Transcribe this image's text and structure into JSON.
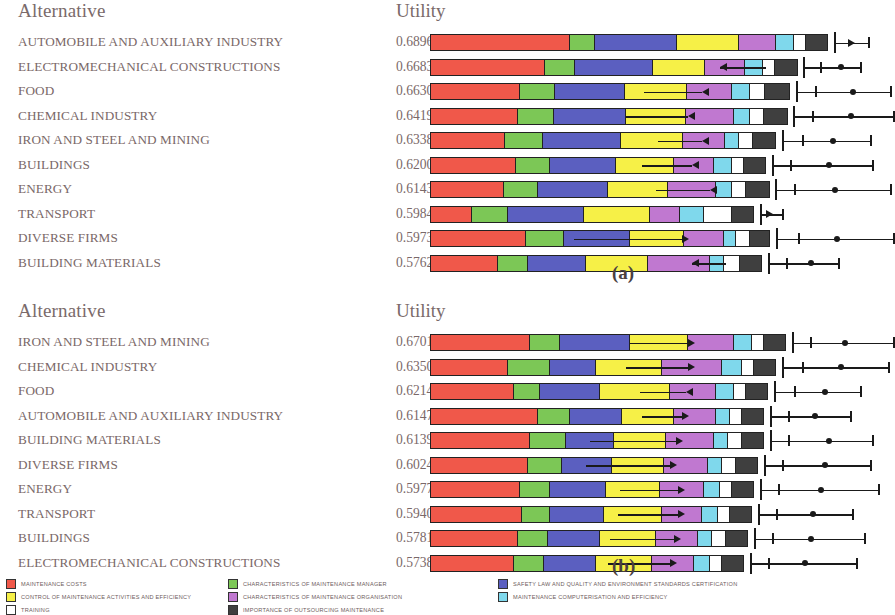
{
  "columns": {
    "alternative": "Alternative",
    "utility": "Utility"
  },
  "captions": {
    "a": "(a)",
    "b": "(b)"
  },
  "colors": {
    "maintenance_costs": "#F0584A",
    "control_of_maintenance_activities": "#F6F047",
    "training": "#FFFFFF",
    "characteristics_manager": "#7CC756",
    "characteristics_organisation": "#C078D0",
    "importance_outsourcing": "#3F3F3F",
    "safety_law": "#5B5FC0",
    "computerisation": "#7FD8EC",
    "outline": "#1a1a1a"
  },
  "legend": {
    "columns": [
      {
        "items": [
          {
            "label": "MAINTENANCE COSTS",
            "color": "#F0584A"
          },
          {
            "label": "CONTROL OF MAINTENANCE ACTIVITIES AND EFFICIENCY",
            "color": "#F6F047"
          },
          {
            "label": "TRAINING",
            "color": "#FFFFFF"
          }
        ]
      },
      {
        "items": [
          {
            "label": "CHARACTERISTICS OF MAINTENANCE MANAGER",
            "color": "#7CC756"
          },
          {
            "label": "CHARACTERISTICS OF MAINTENANCE ORGANISATION",
            "color": "#C078D0"
          },
          {
            "label": "IMPORTANCE OF OUTSOURCING MAINTENANCE",
            "color": "#3F3F3F"
          }
        ]
      },
      {
        "items": [
          {
            "label": "SAFETY LAW AND QUALITY AND ENVIRONMENT STANDARDS CERTIFICATION",
            "color": "#5B5FC0"
          },
          {
            "label": "MAINTENANCE COMPUTERISATION AND EFFICIENCY",
            "color": "#7FD8EC"
          }
        ]
      }
    ]
  },
  "chart_data": [
    {
      "id": "a",
      "type": "bar",
      "orientation": "horizontal",
      "stacked": true,
      "title": "(a)",
      "xlabel": "",
      "ylabel": "Alternative",
      "value_label": "Utility",
      "series": [
        {
          "name": "MAINTENANCE COSTS",
          "color": "#F0584A"
        },
        {
          "name": "CHARACTERISTICS OF MAINTENANCE MANAGER",
          "color": "#7CC756"
        },
        {
          "name": "SAFETY LAW AND QUALITY AND ENVIRONMENT STANDARDS CERTIFICATION",
          "color": "#5B5FC0"
        },
        {
          "name": "CONTROL OF MAINTENANCE ACTIVITIES AND EFFICIENCY",
          "color": "#F6F047"
        },
        {
          "name": "CHARACTERISTICS OF MAINTENANCE ORGANISATION",
          "color": "#C078D0"
        },
        {
          "name": "MAINTENANCE COMPUTERISATION AND EFFICIENCY",
          "color": "#7FD8EC"
        },
        {
          "name": "TRAINING",
          "color": "#FFFFFF"
        },
        {
          "name": "IMPORTANCE OF OUTSOURCING MAINTENANCE",
          "color": "#3F3F3F"
        }
      ],
      "rows": [
        {
          "alternative": "AUTOMOBILE AND AUXILIARY INDUSTRY",
          "utility": "0.6896",
          "segments": [
            140,
            25,
            82,
            62,
            37,
            18,
            12,
            22
          ],
          "bar_total": 398,
          "tick": 404,
          "whisk_start": 404,
          "whisk_end": 438,
          "markers": [],
          "dots": [],
          "inner_line": null,
          "arrow": {
            "x": 418,
            "dir": "right"
          }
        },
        {
          "alternative": "ELECTROMECHANICAL CONSTRUCTIONS",
          "utility": "0.6683",
          "segments": [
            115,
            30,
            78,
            52,
            40,
            18,
            12,
            23
          ],
          "bar_total": 368,
          "tick": 373,
          "whisk_start": 373,
          "whisk_end": 430,
          "markers": [
            390
          ],
          "dots": [
            408
          ],
          "inner_line": {
            "x1": 290,
            "x2": 336
          },
          "arrow": {
            "x": 290,
            "dir": "left"
          }
        },
        {
          "alternative": "FOOD",
          "utility": "0.6630",
          "segments": [
            90,
            35,
            70,
            62,
            45,
            18,
            15,
            25
          ],
          "bar_total": 360,
          "tick": 366,
          "whisk_start": 366,
          "whisk_end": 460,
          "markers": [
            385
          ],
          "dots": [
            420
          ],
          "inner_line": {
            "x1": 214,
            "x2": 272
          },
          "arrow": {
            "x": 272,
            "dir": "left"
          }
        },
        {
          "alternative": "CHEMICAL INDUSTRY",
          "utility": "0.6419",
          "segments": [
            88,
            36,
            72,
            60,
            48,
            16,
            14,
            24
          ],
          "bar_total": 358,
          "tick": 363,
          "whisk_start": 363,
          "whisk_end": 463,
          "markers": [
            382
          ],
          "dots": [
            418
          ],
          "inner_line": {
            "x1": 196,
            "x2": 258
          },
          "arrow": {
            "x": 258,
            "dir": "left"
          }
        },
        {
          "alternative": "IRON AND STEEL AND MINING",
          "utility": "0.6338",
          "segments": [
            75,
            38,
            78,
            62,
            42,
            14,
            14,
            23
          ],
          "bar_total": 346,
          "tick": 352,
          "whisk_start": 352,
          "whisk_end": 440,
          "markers": [
            372
          ],
          "dots": [
            400
          ],
          "inner_line": {
            "x1": 228,
            "x2": 272
          },
          "arrow": {
            "x": 272,
            "dir": "left"
          }
        },
        {
          "alternative": "BUILDINGS",
          "utility": "0.6200",
          "segments": [
            86,
            34,
            66,
            58,
            40,
            18,
            12,
            22
          ],
          "bar_total": 336,
          "tick": 342,
          "whisk_start": 342,
          "whisk_end": 442,
          "markers": [
            360
          ],
          "dots": [
            396
          ],
          "inner_line": {
            "x1": 212,
            "x2": 262
          },
          "arrow": {
            "x": 262,
            "dir": "left"
          }
        },
        {
          "alternative": "ENERGY",
          "utility": "0.6143",
          "segments": [
            74,
            34,
            70,
            60,
            48,
            16,
            14,
            24
          ],
          "bar_total": 340,
          "tick": 345,
          "whisk_start": 345,
          "whisk_end": 460,
          "markers": [
            364
          ],
          "dots": [
            402
          ],
          "inner_line": {
            "x1": 226,
            "x2": 280
          },
          "arrow": {
            "x": 280,
            "dir": "left"
          }
        },
        {
          "alternative": "TRANSPORT",
          "utility": "0.5984",
          "segments": [
            42,
            36,
            76,
            66,
            30,
            24,
            28,
            22
          ],
          "bar_total": 324,
          "tick": 330,
          "whisk_start": 330,
          "whisk_end": 352,
          "markers": [],
          "dots": [],
          "inner_line": null,
          "arrow": {
            "x": 336,
            "dir": "right"
          }
        },
        {
          "alternative": "DIVERSE FIRMS",
          "utility": "0.5973",
          "segments": [
            96,
            38,
            66,
            54,
            40,
            12,
            14,
            20
          ],
          "bar_total": 340,
          "tick": 346,
          "whisk_start": 346,
          "whisk_end": 463,
          "markers": [
            368
          ],
          "dots": [
            404
          ],
          "inner_line": {
            "x1": 144,
            "x2": 252
          },
          "arrow": {
            "x": 252,
            "dir": "right"
          }
        },
        {
          "alternative": "BUILDING MATERIALS",
          "utility": "0.5762",
          "segments": [
            68,
            30,
            58,
            62,
            62,
            14,
            16,
            22
          ],
          "bar_total": 332,
          "tick": 338,
          "whisk_start": 338,
          "whisk_end": 408,
          "markers": [
            356
          ],
          "dots": [
            378
          ],
          "inner_line": {
            "x1": 262,
            "x2": 296
          },
          "arrow": {
            "x": 262,
            "dir": "left"
          }
        }
      ]
    },
    {
      "id": "b",
      "type": "bar",
      "orientation": "horizontal",
      "stacked": true,
      "title": "(b)",
      "xlabel": "",
      "ylabel": "Alternative",
      "value_label": "Utility",
      "series": [
        {
          "name": "MAINTENANCE COSTS",
          "color": "#F0584A"
        },
        {
          "name": "CHARACTERISTICS OF MAINTENANCE MANAGER",
          "color": "#7CC756"
        },
        {
          "name": "SAFETY LAW AND QUALITY AND ENVIRONMENT STANDARDS CERTIFICATION",
          "color": "#5B5FC0"
        },
        {
          "name": "CONTROL OF MAINTENANCE ACTIVITIES AND EFFICIENCY",
          "color": "#F6F047"
        },
        {
          "name": "CHARACTERISTICS OF MAINTENANCE ORGANISATION",
          "color": "#C078D0"
        },
        {
          "name": "MAINTENANCE COMPUTERISATION AND EFFICIENCY",
          "color": "#7FD8EC"
        },
        {
          "name": "TRAINING",
          "color": "#FFFFFF"
        },
        {
          "name": "IMPORTANCE OF OUTSOURCING MAINTENANCE",
          "color": "#3F3F3F"
        }
      ],
      "rows": [
        {
          "alternative": "IRON AND STEEL AND MINING",
          "utility": "0.6701",
          "segments": [
            100,
            30,
            70,
            58,
            46,
            18,
            12,
            22
          ],
          "bar_total": 356,
          "tick": 362,
          "whisk_start": 362,
          "whisk_end": 463,
          "markers": [
            380
          ],
          "dots": [
            412
          ],
          "inner_line": {
            "x1": 200,
            "x2": 258
          },
          "arrow": {
            "x": 258,
            "dir": "right"
          }
        },
        {
          "alternative": "CHEMICAL INDUSTRY",
          "utility": "0.6350",
          "segments": [
            78,
            42,
            46,
            66,
            60,
            20,
            12,
            22
          ],
          "bar_total": 346,
          "tick": 352,
          "whisk_start": 352,
          "whisk_end": 458,
          "markers": [
            372
          ],
          "dots": [
            408
          ],
          "inner_line": {
            "x1": 196,
            "x2": 258
          },
          "arrow": {
            "x": 258,
            "dir": "right"
          }
        },
        {
          "alternative": "FOOD",
          "utility": "0.6214",
          "segments": [
            84,
            26,
            60,
            70,
            46,
            18,
            12,
            22
          ],
          "bar_total": 338,
          "tick": 344,
          "whisk_start": 344,
          "whisk_end": 430,
          "markers": [
            364
          ],
          "dots": [
            392
          ],
          "inner_line": {
            "x1": 210,
            "x2": 256
          },
          "arrow": {
            "x": 256,
            "dir": "left"
          }
        },
        {
          "alternative": "AUTOMOBILE AND AUXILIARY INDUSTRY",
          "utility": "0.6147",
          "segments": [
            108,
            32,
            52,
            52,
            42,
            14,
            12,
            22
          ],
          "bar_total": 334,
          "tick": 340,
          "whisk_start": 340,
          "whisk_end": 420,
          "markers": [
            358
          ],
          "dots": [
            382
          ],
          "inner_line": {
            "x1": 212,
            "x2": 252
          },
          "arrow": {
            "x": 252,
            "dir": "right"
          }
        },
        {
          "alternative": "BUILDING MATERIALS",
          "utility": "0.6139",
          "segments": [
            100,
            36,
            48,
            52,
            48,
            14,
            14,
            22
          ],
          "bar_total": 334,
          "tick": 340,
          "whisk_start": 340,
          "whisk_end": 442,
          "markers": [
            358
          ],
          "dots": [
            396
          ],
          "inner_line": {
            "x1": 160,
            "x2": 246
          },
          "arrow": {
            "x": 246,
            "dir": "right"
          }
        },
        {
          "alternative": "DIVERSE FIRMS",
          "utility": "0.6024",
          "segments": [
            98,
            34,
            50,
            52,
            44,
            14,
            14,
            22
          ],
          "bar_total": 328,
          "tick": 334,
          "whisk_start": 334,
          "whisk_end": 440,
          "markers": [
            352
          ],
          "dots": [
            392
          ],
          "inner_line": {
            "x1": 156,
            "x2": 240
          },
          "arrow": {
            "x": 240,
            "dir": "right"
          }
        },
        {
          "alternative": "ENERGY",
          "utility": "0.5977",
          "segments": [
            90,
            30,
            56,
            54,
            44,
            16,
            12,
            22
          ],
          "bar_total": 324,
          "tick": 330,
          "whisk_start": 330,
          "whisk_end": 448,
          "markers": [
            348
          ],
          "dots": [
            388
          ],
          "inner_line": {
            "x1": 190,
            "x2": 248
          },
          "arrow": {
            "x": 248,
            "dir": "right"
          }
        },
        {
          "alternative": "TRANSPORT",
          "utility": "0.5940",
          "segments": [
            92,
            28,
            54,
            58,
            40,
            16,
            12,
            22
          ],
          "bar_total": 322,
          "tick": 328,
          "whisk_start": 328,
          "whisk_end": 422,
          "markers": [
            346
          ],
          "dots": [
            380
          ],
          "inner_line": {
            "x1": 188,
            "x2": 248
          },
          "arrow": {
            "x": 248,
            "dir": "right"
          }
        },
        {
          "alternative": "BUILDINGS",
          "utility": "0.5781",
          "segments": [
            88,
            30,
            52,
            56,
            42,
            14,
            14,
            22
          ],
          "bar_total": 318,
          "tick": 324,
          "whisk_start": 324,
          "whisk_end": 434,
          "markers": [
            342
          ],
          "dots": [
            378
          ],
          "inner_line": {
            "x1": 180,
            "x2": 244
          },
          "arrow": {
            "x": 244,
            "dir": "right"
          }
        },
        {
          "alternative": "ELECTROMECHANICAL CONSTRUCTIONS",
          "utility": "0.5738",
          "segments": [
            84,
            30,
            52,
            56,
            42,
            16,
            12,
            22
          ],
          "bar_total": 314,
          "tick": 320,
          "whisk_start": 320,
          "whisk_end": 426,
          "markers": [
            338
          ],
          "dots": [
            372
          ],
          "inner_line": {
            "x1": 178,
            "x2": 240
          },
          "arrow": {
            "x": 240,
            "dir": "right"
          }
        }
      ]
    }
  ]
}
